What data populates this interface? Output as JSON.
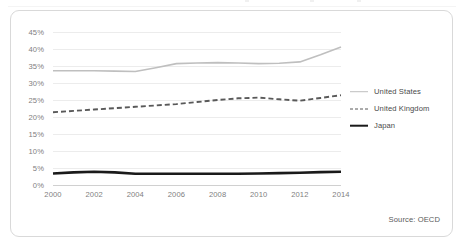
{
  "source_note": "Source: OECD",
  "legend": {
    "position": "right",
    "items": [
      {
        "label": "United States",
        "color": "#bfbfbf",
        "style": "solid",
        "width": 1.6
      },
      {
        "label": "United Kingdom",
        "color": "#595959",
        "style": "dashed",
        "width": 1.9
      },
      {
        "label": "Japan",
        "color": "#1a1a1a",
        "style": "solid",
        "width": 2.6
      }
    ]
  },
  "chart_data": {
    "type": "line",
    "title": "",
    "subtitle": "",
    "xlabel": "",
    "ylabel": "",
    "grid": true,
    "xlim": [
      2000,
      2014
    ],
    "ylim": [
      0,
      45
    ],
    "y_tick_labels": [
      "45%",
      "40%",
      "35%",
      "30%",
      "25%",
      "20%",
      "15%",
      "10%",
      "5%",
      "0%"
    ],
    "y_ticks": [
      45,
      40,
      35,
      30,
      25,
      20,
      15,
      10,
      5,
      0
    ],
    "x_tick_labels": [
      "2000",
      "2002",
      "2004",
      "2006",
      "2008",
      "2010",
      "2012",
      "2014"
    ],
    "x_ticks": [
      2000,
      2002,
      2004,
      2006,
      2008,
      2010,
      2012,
      2014
    ],
    "x": [
      2000,
      2001,
      2002,
      2003,
      2004,
      2005,
      2006,
      2007,
      2008,
      2009,
      2010,
      2011,
      2012,
      2013,
      2014
    ],
    "series": [
      {
        "name": "United States",
        "color": "#bfbfbf",
        "style": "solid",
        "width": 1.6,
        "values": [
          33.6,
          33.6,
          33.6,
          33.5,
          33.4,
          34.5,
          35.7,
          35.9,
          36.0,
          35.9,
          35.7,
          35.8,
          36.2,
          38.3,
          40.6
        ]
      },
      {
        "name": "United Kingdom",
        "color": "#595959",
        "style": "dashed",
        "width": 1.9,
        "values": [
          21.4,
          21.8,
          22.2,
          22.6,
          23.0,
          23.4,
          23.8,
          24.4,
          25.0,
          25.5,
          25.7,
          25.2,
          24.8,
          25.6,
          26.4
        ]
      },
      {
        "name": "Japan",
        "color": "#1a1a1a",
        "style": "solid",
        "width": 2.6,
        "values": [
          3.4,
          3.7,
          3.9,
          3.7,
          3.3,
          3.3,
          3.3,
          3.3,
          3.3,
          3.3,
          3.4,
          3.5,
          3.6,
          3.8,
          3.9
        ]
      }
    ]
  }
}
